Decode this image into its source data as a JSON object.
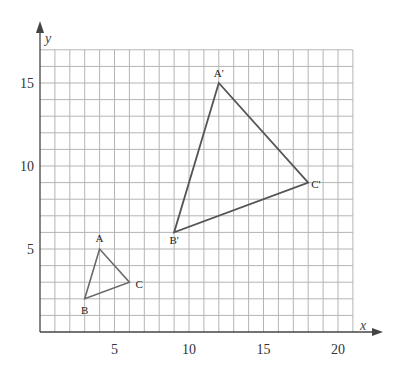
{
  "diagram": {
    "type": "coordinate-grid-transformation",
    "axes": {
      "x_label": "x",
      "y_label": "y",
      "x_range": [
        0,
        21
      ],
      "y_range": [
        0,
        17
      ],
      "x_ticks": [
        {
          "value": 5,
          "label": "5"
        },
        {
          "value": 10,
          "label": "10"
        },
        {
          "value": 15,
          "label": "15"
        },
        {
          "value": 20,
          "label": "20"
        }
      ],
      "y_ticks": [
        {
          "value": 5,
          "label": "5"
        },
        {
          "value": 10,
          "label": "10"
        },
        {
          "value": 15,
          "label": "15"
        }
      ]
    },
    "grid": {
      "step": 1,
      "color": "#b4b4b4"
    },
    "triangles": [
      {
        "name": "ABC",
        "color": "#6a6a6a",
        "vertices": [
          {
            "label": "A",
            "x": 4,
            "y": 5
          },
          {
            "label": "B",
            "x": 3,
            "y": 2
          },
          {
            "label": "C",
            "x": 6,
            "y": 3
          }
        ]
      },
      {
        "name": "A'B'C'",
        "color": "#555555",
        "vertices": [
          {
            "label": "A'",
            "x": 12,
            "y": 15
          },
          {
            "label": "B'",
            "x": 9,
            "y": 6
          },
          {
            "label": "C'",
            "x": 18,
            "y": 9
          }
        ]
      }
    ]
  }
}
